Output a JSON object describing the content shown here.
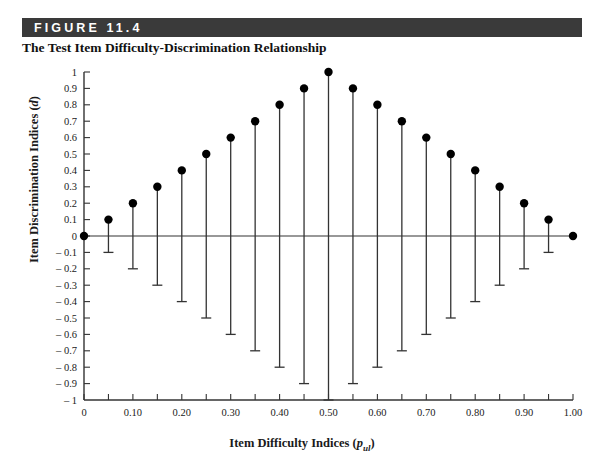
{
  "figure": {
    "banner_label": "FIGURE 11.4",
    "title": "The Test Item Difficulty-Discrimination Relationship",
    "banner_color": "#3a3a3a"
  },
  "chart_data": {
    "type": "scatter",
    "title": "The Test Item Difficulty-Discrimination Relationship",
    "xlabel": "Item Difficulty Indices (p_ul)",
    "xlabel_parts": {
      "text": "Item Difficulty Indices (",
      "italic": "p",
      "subscript": "ul",
      "tail": ")"
    },
    "ylabel": "Item Discrimination Indices (d)",
    "ylabel_parts": {
      "text": "Item Discrimination Indices (",
      "italic": "d",
      "tail": ")"
    },
    "xlim": [
      0,
      1
    ],
    "ylim": [
      -1,
      1
    ],
    "grid": false,
    "legend": null,
    "x_ticks": [
      0,
      0.05,
      0.1,
      0.15,
      0.2,
      0.25,
      0.3,
      0.35,
      0.4,
      0.45,
      0.5,
      0.55,
      0.6,
      0.65,
      0.7,
      0.75,
      0.8,
      0.85,
      0.9,
      0.95,
      1.0
    ],
    "x_tick_labels": [
      "0",
      "",
      "0.10",
      "",
      "0.20",
      "",
      "0.30",
      "",
      "0.40",
      "",
      "0.50",
      "",
      "0.60",
      "",
      "0.70",
      "",
      "0.80",
      "",
      "0.90",
      "",
      "1.00"
    ],
    "y_ticks": [
      1,
      0.9,
      0.8,
      0.7,
      0.6,
      0.5,
      0.4,
      0.3,
      0.2,
      0.1,
      0,
      -0.1,
      -0.2,
      -0.3,
      -0.4,
      -0.5,
      -0.6,
      -0.7,
      -0.8,
      -0.9,
      -1
    ],
    "y_tick_labels": [
      "1",
      "0.9",
      "0.8",
      "0.7",
      "0.6",
      "0.5",
      "0.4",
      "0.3",
      "0.2",
      "0.1",
      "0",
      "– 0.1",
      "– 0.2",
      "– 0.3",
      "– 0.4",
      "– 0.5",
      "– 0.6",
      "– 0.7",
      "– 0.8",
      "– 0.9",
      "– 1"
    ],
    "x": [
      0,
      0.05,
      0.1,
      0.15,
      0.2,
      0.25,
      0.3,
      0.35,
      0.4,
      0.45,
      0.5,
      0.55,
      0.6,
      0.65,
      0.7,
      0.75,
      0.8,
      0.85,
      0.9,
      0.95,
      1.0
    ],
    "values": [
      0,
      0.1,
      0.2,
      0.3,
      0.4,
      0.5,
      0.6,
      0.7,
      0.8,
      0.9,
      1.0,
      0.9,
      0.8,
      0.7,
      0.6,
      0.5,
      0.4,
      0.3,
      0.2,
      0.1,
      0
    ],
    "lower": [
      0,
      -0.1,
      -0.2,
      -0.3,
      -0.4,
      -0.5,
      -0.6,
      -0.7,
      -0.8,
      -0.9,
      -1.0,
      -0.9,
      -0.8,
      -0.7,
      -0.6,
      -0.5,
      -0.4,
      -0.3,
      -0.2,
      -0.1,
      0
    ],
    "marker_color": "#000000",
    "stem_color": "#333333",
    "axis_color": "#333333"
  }
}
